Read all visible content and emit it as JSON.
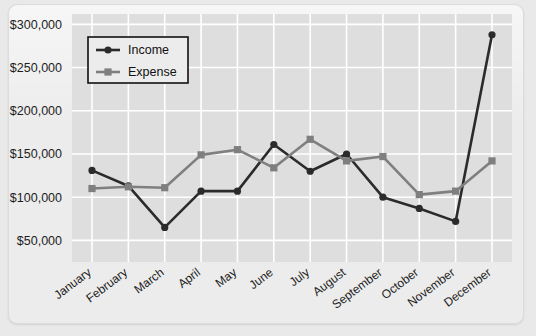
{
  "chart_data": {
    "type": "line",
    "title": "",
    "xlabel": "",
    "ylabel": "",
    "categories": [
      "January",
      "February",
      "March",
      "April",
      "May",
      "June",
      "July",
      "August",
      "September",
      "October",
      "November",
      "December"
    ],
    "series": [
      {
        "name": "Income",
        "color": "#2b2b2b",
        "marker": "circle",
        "values": [
          131000,
          113000,
          65000,
          107000,
          107000,
          161000,
          130000,
          150000,
          100000,
          87000,
          72000,
          288000
        ]
      },
      {
        "name": "Expense",
        "color": "#7f7f7f",
        "marker": "square",
        "values": [
          110000,
          112000,
          111000,
          149000,
          155000,
          134000,
          167000,
          142000,
          147000,
          103000,
          107000,
          142000
        ]
      }
    ],
    "ylim": [
      25000,
      312000
    ],
    "yticks": [
      50000,
      100000,
      150000,
      200000,
      250000,
      300000
    ],
    "ytick_labels": [
      "$50,000",
      "$100,000",
      "$150,000",
      "$200,000",
      "$250,000",
      "$300,000"
    ],
    "grid": true,
    "legend_position": "upper-left",
    "legend_entries": [
      "Income",
      "Expense"
    ]
  },
  "colors": {
    "background": "#e9e9e9",
    "panel": "#ececec",
    "plot_area": "#dedede",
    "gridline": "#ffffff",
    "income": "#2b2b2b",
    "expense": "#7f7f7f",
    "text": "#1d1d1d"
  }
}
